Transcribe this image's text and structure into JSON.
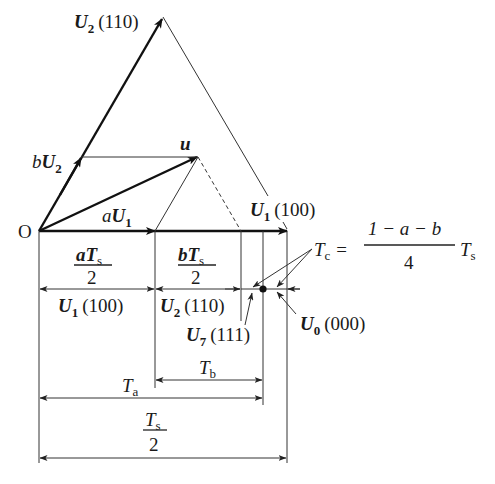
{
  "figure": {
    "origin_label": "O",
    "vectors": {
      "U2": {
        "name": "U",
        "sub": "2",
        "code": "(110)"
      },
      "bU2": {
        "coef": "b",
        "name": "U",
        "sub": "2"
      },
      "u": {
        "name": "u"
      },
      "aU1": {
        "coef": "a",
        "name": "U",
        "sub": "1"
      },
      "U1": {
        "name": "U",
        "sub": "1",
        "code": "(100)"
      }
    },
    "dimensions": {
      "aTs_over_2": {
        "num": "aT",
        "num_sub": "s",
        "den": "2"
      },
      "bTs_over_2": {
        "num": "bT",
        "num_sub": "s",
        "den": "2"
      },
      "Ta": {
        "main": "T",
        "sub": "a"
      },
      "Tb": {
        "main": "T",
        "sub": "b"
      },
      "Ts_over_2": {
        "num": "T",
        "num_sub": "s",
        "den": "2"
      }
    },
    "states": {
      "U1_100": {
        "name": "U",
        "sub": "1",
        "code": "(100)"
      },
      "U2_110": {
        "name": "U",
        "sub": "2",
        "code": "(110)"
      },
      "U7_111": {
        "name": "U",
        "sub": "7",
        "code": "(111)"
      },
      "U0_000": {
        "name": "U",
        "sub": "0",
        "code": "(000)"
      }
    },
    "formula": {
      "lhs": "T",
      "lhs_sub": "c",
      "eq": "=",
      "numerator": "1 − a − b",
      "denominator": "4",
      "rhs": "T",
      "rhs_sub": "s"
    }
  }
}
